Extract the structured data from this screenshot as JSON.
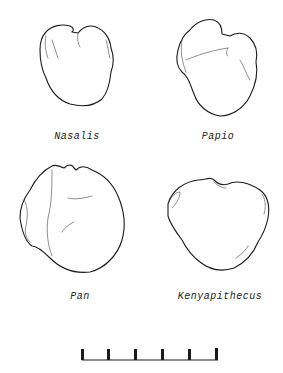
{
  "figure": {
    "specimens": [
      {
        "label": "Nasalis",
        "position": "top-left"
      },
      {
        "label": "Papio",
        "position": "top-right"
      },
      {
        "label": "Pan",
        "position": "bottom-left"
      },
      {
        "label": "Kenyapithecus",
        "position": "bottom-right"
      }
    ],
    "scale_bar": {
      "ticks": 6
    }
  }
}
